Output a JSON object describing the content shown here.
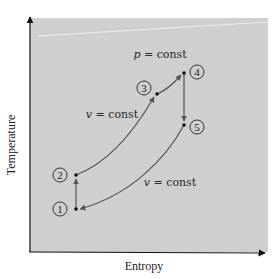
{
  "diagram": {
    "type": "T-s diagram (Temperature vs Entropy)",
    "x_axis_label": "Entropy",
    "y_axis_label": "Temperature",
    "background_color": "#cfcfcf",
    "line_color": "#555555",
    "point_color": "#111111",
    "states": [
      {
        "id": "1",
        "label": "1",
        "x": 76,
        "y": 209
      },
      {
        "id": "2",
        "label": "2",
        "x": 76,
        "y": 175
      },
      {
        "id": "3",
        "label": "3",
        "x": 157,
        "y": 94
      },
      {
        "id": "4",
        "label": "4",
        "x": 184,
        "y": 73
      },
      {
        "id": "5",
        "label": "5",
        "x": 184,
        "y": 125
      }
    ],
    "processes": [
      {
        "from": "1",
        "to": "2",
        "kind": "vertical (isentropic)"
      },
      {
        "from": "2",
        "to": "3",
        "kind": "v = const"
      },
      {
        "from": "3",
        "to": "4",
        "kind": "p = const"
      },
      {
        "from": "4",
        "to": "5",
        "kind": "vertical (isentropic)"
      },
      {
        "from": "5",
        "to": "1",
        "kind": "v = const"
      }
    ],
    "annotations": {
      "p_const": {
        "var": "p",
        "text": " = const"
      },
      "v_const_upper": {
        "var": "v",
        "text": " = const"
      },
      "v_const_lower": {
        "var": "v",
        "text": " = const"
      }
    }
  }
}
